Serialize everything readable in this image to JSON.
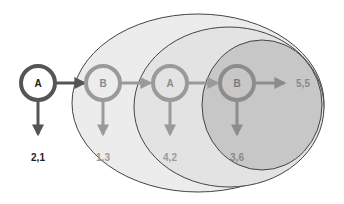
{
  "diagram": {
    "type": "state-transition-with-nested-scopes",
    "colors": {
      "outer_fill": "#ececec",
      "middle_fill": "#e2e2e2",
      "inner_fill": "#c6c6c6",
      "ellipse_stroke": "#444444",
      "active_node": "#555555",
      "faded_node": "#999999",
      "inner_node": "#8a8a8a"
    },
    "nodes": [
      {
        "id": "n1",
        "label": "A",
        "output": "2,1"
      },
      {
        "id": "n2",
        "label": "B",
        "output": "1,3"
      },
      {
        "id": "n3",
        "label": "A",
        "output": "4,2"
      },
      {
        "id": "n4",
        "label": "B",
        "output": "3,6"
      }
    ],
    "final_output": "5,5",
    "edges": [
      {
        "from": "n1",
        "to": "n2"
      },
      {
        "from": "n2",
        "to": "n3"
      },
      {
        "from": "n3",
        "to": "n4"
      },
      {
        "from": "n4",
        "to": "final_output"
      }
    ]
  }
}
